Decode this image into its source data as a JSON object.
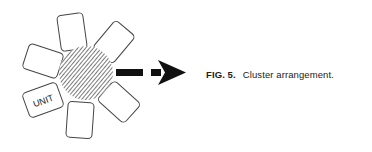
{
  "figure": {
    "caption_label": "FIG. 5.",
    "caption_text": "Cluster arrangement.",
    "unit_label": "UNIT",
    "card_count": 6,
    "center_shape": "hatched-circle",
    "arrow_direction": "right",
    "colors": {
      "stroke": "#333333",
      "arrow": "#111111",
      "background": "#ffffff"
    }
  }
}
